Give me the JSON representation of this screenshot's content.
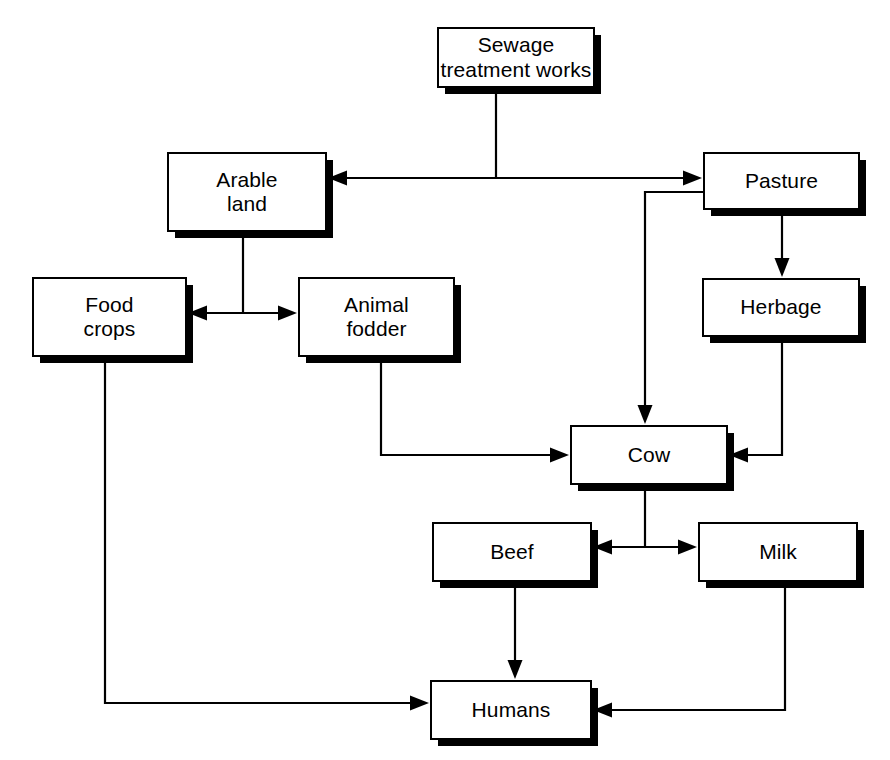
{
  "diagram": {
    "canvas": {
      "width": 890,
      "height": 760
    },
    "stroke_color": "#000000",
    "fill_color": "#ffffff",
    "shadow_color": "#000000",
    "nodes": [
      {
        "id": "sewage",
        "label": "Sewage\ntreatment works",
        "x": 437,
        "y": 27,
        "w": 158,
        "h": 61
      },
      {
        "id": "arable",
        "label": "Arable\nland",
        "x": 167,
        "y": 152,
        "w": 160,
        "h": 80
      },
      {
        "id": "pasture",
        "label": "Pasture",
        "x": 703,
        "y": 152,
        "w": 157,
        "h": 58
      },
      {
        "id": "food",
        "label": "Food\ncrops",
        "x": 32,
        "y": 277,
        "w": 155,
        "h": 80
      },
      {
        "id": "fodder",
        "label": "Animal\nfodder",
        "x": 298,
        "y": 277,
        "w": 157,
        "h": 80
      },
      {
        "id": "herbage",
        "label": "Herbage",
        "x": 702,
        "y": 278,
        "w": 158,
        "h": 59
      },
      {
        "id": "cow",
        "label": "Cow",
        "x": 570,
        "y": 425,
        "w": 158,
        "h": 60
      },
      {
        "id": "beef",
        "label": "Beef",
        "x": 432,
        "y": 522,
        "w": 160,
        "h": 60
      },
      {
        "id": "milk",
        "label": "Milk",
        "x": 698,
        "y": 522,
        "w": 160,
        "h": 60
      },
      {
        "id": "humans",
        "label": "Humans",
        "x": 430,
        "y": 680,
        "w": 162,
        "h": 60
      }
    ],
    "edges": [
      {
        "id": "sewage-to-arable",
        "from": "sewage",
        "to": "arable",
        "arrow": "end",
        "points": "496,88 496,178 328,178"
      },
      {
        "id": "sewage-to-pasture",
        "from": "sewage",
        "to": "pasture",
        "arrow": "end",
        "points": "496,178 702,178"
      },
      {
        "id": "arable-to-food",
        "from": "arable",
        "to": "food",
        "arrow": "end",
        "points": "243,232 243,313 188,313"
      },
      {
        "id": "arable-to-fodder",
        "from": "arable",
        "to": "fodder",
        "arrow": "end",
        "points": "243,313 297,313"
      },
      {
        "id": "pasture-to-cow",
        "from": "pasture",
        "to": "cow",
        "arrow": "end",
        "points": "703,192 645,192 645,424"
      },
      {
        "id": "pasture-to-herbage",
        "from": "pasture",
        "to": "herbage",
        "arrow": "end",
        "points": "782,210 782,277"
      },
      {
        "id": "herbage-to-cow",
        "from": "herbage",
        "to": "cow",
        "arrow": "end",
        "points": "782,337 782,455 729,455"
      },
      {
        "id": "fodder-to-cow",
        "from": "fodder",
        "to": "cow",
        "arrow": "end",
        "points": "381,357 381,455 569,455"
      },
      {
        "id": "cow-to-beef",
        "from": "cow",
        "to": "beef",
        "arrow": "end",
        "points": "645,485 645,547 593,547"
      },
      {
        "id": "cow-to-milk",
        "from": "cow",
        "to": "milk",
        "arrow": "end",
        "points": "645,547 697,547"
      },
      {
        "id": "beef-to-humans",
        "from": "beef",
        "to": "humans",
        "arrow": "end",
        "points": "515,582 515,679"
      },
      {
        "id": "milk-to-humans",
        "from": "milk",
        "to": "humans",
        "arrow": "end",
        "points": "785,582 785,710 593,710"
      },
      {
        "id": "food-to-humans",
        "from": "food",
        "to": "humans",
        "arrow": "end",
        "points": "105,357 105,703 429,703"
      }
    ]
  }
}
